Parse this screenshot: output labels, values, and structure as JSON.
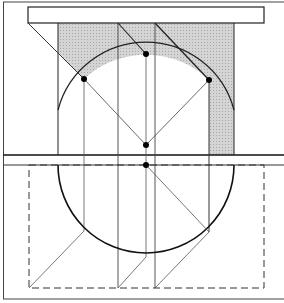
{
  "diagram": {
    "title": "",
    "colors": {
      "line": "#1a1a1a",
      "thin_line": "#444444",
      "shade": "#c8c8c8",
      "background": "#ffffff"
    },
    "points": [
      {
        "name": "left-arc-point",
        "x": 84,
        "y": 79
      },
      {
        "name": "top-arc-point",
        "x": 146,
        "y": 54
      },
      {
        "name": "right-arc-point",
        "x": 209,
        "y": 80
      },
      {
        "name": "upper-center-point",
        "x": 146,
        "y": 145
      },
      {
        "name": "lower-center-point",
        "x": 146,
        "y": 165
      }
    ]
  }
}
